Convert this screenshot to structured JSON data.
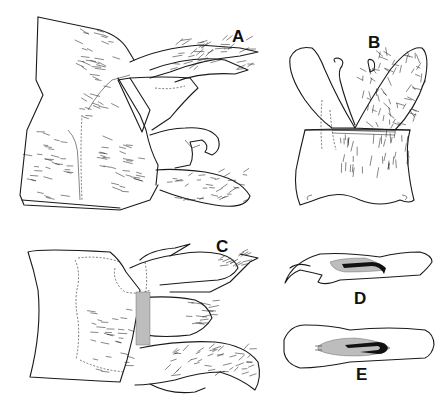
{
  "figure": {
    "type": "scientific line illustration",
    "panels": [
      {
        "id": "A",
        "label": "A",
        "view": "lateral view of terminal segments with setose appendages"
      },
      {
        "id": "B",
        "label": "B",
        "view": "dorsal/ventral view with paired lobes over sclerite"
      },
      {
        "id": "C",
        "label": "C",
        "view": "ventral view of terminal segments with appendages"
      },
      {
        "id": "D",
        "label": "D",
        "view": "lateral view of phallic structure"
      },
      {
        "id": "E",
        "label": "E",
        "view": "dorsal view of phallic structure"
      }
    ],
    "colors": {
      "ink": "#1a1a1a",
      "stipple": "#bdbdbd",
      "background": "#ffffff"
    }
  }
}
